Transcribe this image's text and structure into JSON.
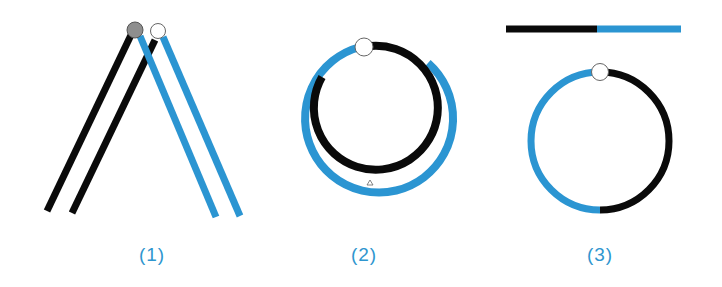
{
  "colors": {
    "black": "#0a0a0a",
    "blue": "#2b95d2",
    "grey_dot": "#8e8e8e",
    "white_dot": "#ffffff",
    "label": "#2f96cf"
  },
  "figures": [
    {
      "id": 1,
      "label": "(1)",
      "description": "Two black lines and two blue lines forming an inverted V, with grey and white dots at apex"
    },
    {
      "id": 2,
      "label": "(2)",
      "description": "Black inner ring and blue outer ring, partial arcs with white dot at top"
    },
    {
      "id": 3,
      "label": "(3)",
      "description": "Horizontal bar half black half blue above a circle half blue (left) half black (right) with white dot at top"
    }
  ]
}
